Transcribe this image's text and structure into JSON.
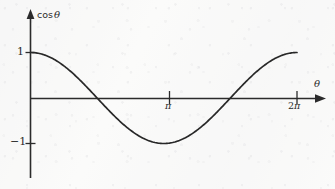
{
  "figure": {
    "name": "cosine-function-graph",
    "background_color": "#fbfbfa",
    "ink_color": "#2b2b2b",
    "curve_color": "#282828"
  },
  "axes": {
    "y_axis": {
      "label": "cos",
      "label_variable": "θ",
      "name": "y-axis"
    },
    "x_axis": {
      "label": "θ",
      "name": "x-axis"
    },
    "y_ticks": [
      {
        "value": 1,
        "label": "1"
      },
      {
        "value": -1,
        "label": "−1"
      }
    ],
    "x_ticks": [
      {
        "value": 3.14159,
        "label": "π",
        "prefix": ""
      },
      {
        "value": 6.28318,
        "label": "π",
        "prefix": "2"
      }
    ]
  },
  "chart_data": {
    "type": "line",
    "title": "",
    "xlabel": "θ",
    "ylabel": "cos θ",
    "xlim": [
      0,
      6.28318
    ],
    "ylim": [
      -1,
      1
    ],
    "grid": false,
    "legend": "none",
    "x_tick_labels": [
      "π",
      "2π"
    ],
    "x_tick_values": [
      3.14159,
      6.28318
    ],
    "y_tick_labels": [
      "1",
      "−1"
    ],
    "y_tick_values": [
      1,
      -1
    ],
    "series": [
      {
        "name": "cos θ",
        "function": "cos(x)",
        "x": [
          0,
          0.3142,
          0.6283,
          0.9425,
          1.2566,
          1.5708,
          1.885,
          2.1991,
          2.5133,
          2.8274,
          3.1416,
          3.4558,
          3.7699,
          4.0841,
          4.3982,
          4.7124,
          5.0265,
          5.3407,
          5.6549,
          5.969,
          6.2832
        ],
        "values": [
          1.0,
          0.951,
          0.809,
          0.588,
          0.309,
          0.0,
          -0.309,
          -0.588,
          -0.809,
          -0.951,
          -1.0,
          -0.951,
          -0.809,
          -0.588,
          -0.309,
          0.0,
          0.309,
          0.588,
          0.809,
          0.951,
          1.0
        ]
      }
    ],
    "annotations": [
      {
        "text": "maximum at θ = 0, value 1"
      },
      {
        "text": "zero crossing at θ = π/2"
      },
      {
        "text": "minimum at θ = π, value −1"
      },
      {
        "text": "zero crossing at θ = 3π/2"
      },
      {
        "text": "maximum at θ = 2π, value 1"
      }
    ]
  }
}
